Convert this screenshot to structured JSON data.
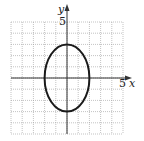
{
  "chart_data": {
    "type": "line",
    "title": "",
    "xlabel": "x",
    "ylabel": "y",
    "xlim": [
      -5,
      5
    ],
    "ylim": [
      -5,
      5
    ],
    "grid": true,
    "tick_labels": {
      "x": "5",
      "y": "5"
    },
    "curve": {
      "kind": "ellipse",
      "equation": "x^2/4 + y^2/9 = 1",
      "center": [
        0,
        0
      ],
      "semi_axis_x": 2,
      "semi_axis_y": 3,
      "color": "#1a1a1a"
    }
  },
  "axes": {
    "x_label": "x",
    "y_label": "y",
    "x_tick": "5",
    "y_tick": "5"
  }
}
